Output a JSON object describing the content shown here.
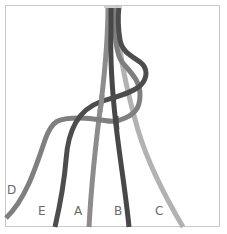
{
  "diagram": {
    "title": "",
    "frame": {
      "border_color": "#c9c9c9",
      "background": "#ffffff"
    },
    "strands": [
      {
        "id": "D",
        "label": "D",
        "color": "#7f7f7f",
        "label_pos": {
          "x": 7,
          "y": 184
        }
      },
      {
        "id": "E",
        "label": "E",
        "color": "#4d4d4d",
        "label_pos": {
          "x": 38,
          "y": 205
        }
      },
      {
        "id": "A",
        "label": "A",
        "color": "#8c8c8c",
        "label_pos": {
          "x": 74,
          "y": 205
        }
      },
      {
        "id": "B",
        "label": "B",
        "color": "#484848",
        "label_pos": {
          "x": 114,
          "y": 205
        }
      },
      {
        "id": "C",
        "label": "C",
        "color": "#b2b2b2",
        "label_pos": {
          "x": 155,
          "y": 205
        }
      }
    ]
  }
}
